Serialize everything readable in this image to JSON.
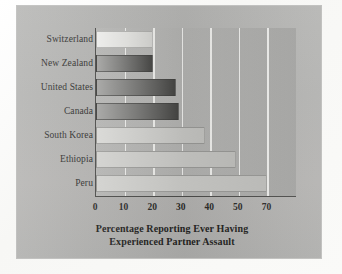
{
  "chart_data": {
    "type": "bar",
    "orientation": "horizontal",
    "title": "",
    "xlabel": "Percentage Reporting Ever Having Experienced Partner Assault",
    "xlabel_line1": "Percentage Reporting Ever Having",
    "xlabel_line2": "Experienced Partner Assault",
    "ylabel": "",
    "categories": [
      "Switzerland",
      "New Zealand",
      "United States",
      "Canada",
      "South Korea",
      "Ethiopia",
      "Peru"
    ],
    "values": [
      20,
      20,
      28,
      29,
      38,
      49,
      70
    ],
    "xticks": [
      0,
      10,
      20,
      30,
      40,
      50,
      70
    ],
    "xtick_labels": [
      "0",
      "10",
      "20",
      "30",
      "40",
      "50",
      "70"
    ],
    "xlim": [
      0,
      78
    ],
    "grid": true,
    "grid_axis": "x",
    "legend": "none",
    "bar_tones": [
      "pale",
      "dark",
      "dark",
      "dark",
      "mid",
      "light",
      "light"
    ]
  },
  "figure": {
    "panel_color": "#b3b3b1",
    "page_color": "#fbfbfa",
    "axis_color": "#4d4d4b",
    "gridline_color": "#fafaf8",
    "text_color": "#2b2b29"
  }
}
